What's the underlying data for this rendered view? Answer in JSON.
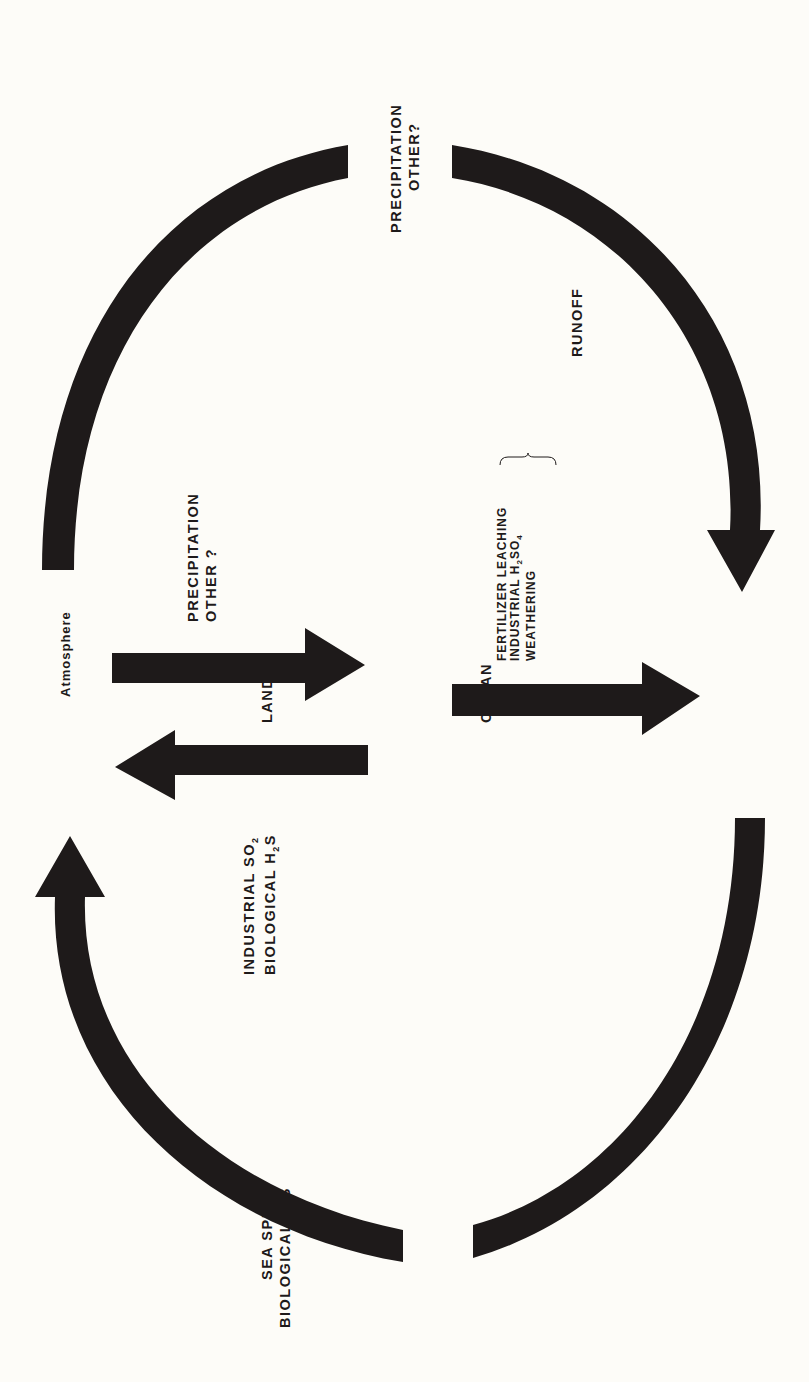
{
  "diagram": {
    "orientation": "rotated -90deg",
    "colors": {
      "ink": "#1e1a1a",
      "background": "#fdfcf8"
    },
    "nodes": {
      "atmosphere": "Atmosphere",
      "land": "LAND",
      "ocean": "OCEAN"
    },
    "flows": {
      "atmosphere_to_ocean": {
        "lines": [
          "PRECIPITATION",
          "OTHER?"
        ]
      },
      "atmosphere_to_land": {
        "lines": [
          "PRECIPITATION",
          "OTHER ?"
        ]
      },
      "land_to_atmosphere": {
        "lines": [
          {
            "text": "INDUSTRIAL SO",
            "sub": "2"
          },
          {
            "text": "BIOLOGICAL H",
            "sub": "2",
            "after": "S"
          }
        ]
      },
      "land_to_ocean": {
        "lines": [
          {
            "text": "FERTILIZER LEACHING"
          },
          {
            "text": "INDUSTRIAL  H",
            "sub": "2",
            "after": "SO",
            "sub2": "4"
          },
          {
            "text": "WEATHERING"
          }
        ],
        "group_label": "RUNOFF"
      },
      "ocean_to_atmosphere": {
        "lines": [
          {
            "text": "SEA SPRAY"
          },
          {
            "text": "BIOLOGICAL H",
            "sub": "2",
            "after": "S"
          }
        ]
      }
    },
    "arrows": [
      {
        "from": "atmosphere",
        "to": "ocean",
        "shape": "curved",
        "side": "top"
      },
      {
        "from": "ocean",
        "to": "atmosphere",
        "shape": "curved",
        "side": "bottom"
      },
      {
        "from": "atmosphere",
        "to": "land",
        "shape": "straight"
      },
      {
        "from": "land",
        "to": "atmosphere",
        "shape": "straight"
      },
      {
        "from": "land",
        "to": "ocean",
        "shape": "straight"
      }
    ]
  }
}
